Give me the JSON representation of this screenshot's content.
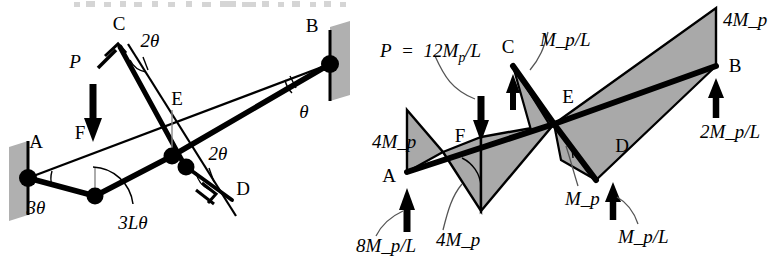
{
  "figure": {
    "background": "#ffffff",
    "ink": "#000000",
    "shade": "#a9a9a9",
    "wall_fill": "#b0b0b0",
    "top_cropped_text": ""
  },
  "left_panel": {
    "name": "collapse-mechanism",
    "nodes": {
      "A": "A",
      "B": "B",
      "C": "C",
      "D": "D",
      "E": "E",
      "F": "F"
    },
    "load": {
      "symbol": "P"
    },
    "angles": {
      "at_A": "3θ",
      "at_C": "2θ",
      "at_D": "2θ",
      "at_B": "θ"
    },
    "displacement": "3Lθ"
  },
  "right_panel": {
    "name": "bending-moment-diagram",
    "nodes": {
      "A": "A",
      "B": "B",
      "C": "C",
      "D": "D",
      "E": "E",
      "F": "F"
    },
    "load": {
      "expression": "P = 12M_p/L",
      "parts": {
        "p": "P",
        "eq": "=",
        "coeff": "12",
        "m": "M",
        "sub": "p",
        "denom": "/L"
      }
    },
    "moments": {
      "at_A": "4M_p",
      "at_F": "4M_p",
      "at_E_lower": "M_p",
      "at_B": "4M_p"
    },
    "reactions": {
      "at_A": "8M_p/L",
      "at_C": "M_p/L",
      "at_D": "M_p/L",
      "at_B": "2M_p/L"
    }
  }
}
